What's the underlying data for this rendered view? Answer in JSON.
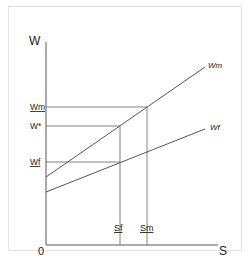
{
  "diagram": {
    "y_axis_label": "W",
    "x_axis_label": "S",
    "origin_label": "0",
    "y_ticks": [
      {
        "label": "Wm",
        "underline": true
      },
      {
        "label": "W*",
        "underline": false
      },
      {
        "label": "Wf",
        "underline": true
      }
    ],
    "x_ticks": [
      {
        "label": "Sf",
        "underline": true
      },
      {
        "label": "Sm",
        "underline": true
      }
    ],
    "lines": [
      {
        "label": "Wm"
      },
      {
        "label": "Wf"
      }
    ],
    "colors": {
      "line": "#555555",
      "text": "#222222",
      "frame": "#e3e3e3"
    }
  }
}
